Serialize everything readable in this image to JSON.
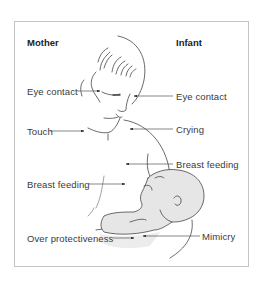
{
  "diagram": {
    "columns": {
      "left_heading": "Mother",
      "right_heading": "Infant"
    },
    "mother_labels": [
      {
        "id": "eye-contact",
        "text": "Eye contact"
      },
      {
        "id": "touch",
        "text": "Touch"
      },
      {
        "id": "breast-feeding",
        "text": "Breast feeding"
      },
      {
        "id": "over-protectiveness",
        "text": "Over protectiveness"
      }
    ],
    "infant_labels": [
      {
        "id": "eye-contact",
        "text": "Eye contact"
      },
      {
        "id": "crying",
        "text": "Crying"
      },
      {
        "id": "breast-feeding",
        "text": "Breast feeding"
      },
      {
        "id": "mimicry",
        "text": "Mimicry"
      }
    ],
    "illustration": "mother-holding-and-breastfeeding-infant",
    "colors": {
      "line": "#333333",
      "frame": "#c4c4c4",
      "infant_fill": "#e6e6e6",
      "text": "#3a3a3a"
    }
  }
}
